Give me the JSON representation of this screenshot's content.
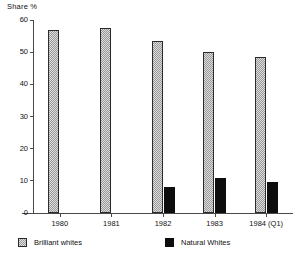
{
  "chart_data": {
    "type": "bar",
    "title": "",
    "ylabel": "Share %",
    "xlabel": "",
    "ylim": [
      0,
      60
    ],
    "yticks": [
      0,
      10,
      20,
      30,
      40,
      50,
      60
    ],
    "grid": false,
    "legend_position": "bottom",
    "categories": [
      "1980",
      "1981",
      "1982",
      "1983",
      "1984  (Q1)"
    ],
    "series": [
      {
        "name": "Brilliant whites",
        "color": "#dcdcdc",
        "pattern": "checkered",
        "values": [
          57,
          57.5,
          53.5,
          50,
          48.5
        ]
      },
      {
        "name": "Natural Whites",
        "color": "#0d0d0d",
        "pattern": "solid",
        "values": [
          null,
          null,
          8,
          11,
          9.5
        ]
      }
    ]
  },
  "legend": {
    "items": [
      {
        "label": "Brilliant whites",
        "swatch": "checkered-swatch"
      },
      {
        "label": "Natural Whites",
        "swatch": "solid-black-swatch"
      }
    ]
  }
}
